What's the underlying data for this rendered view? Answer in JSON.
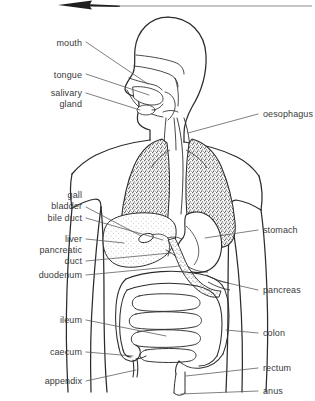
{
  "diagram": {
    "background_color": "#ffffff",
    "stroke_color": "#2b2b2b",
    "label_color": "#3a3a3a",
    "leader_line_color": "#555555",
    "stipple_color": "#4a4a4a",
    "arrow": {
      "name": "scroll-up-arrow",
      "direction": "left"
    },
    "labels_left": [
      {
        "id": "mouth",
        "text": "mouth",
        "text2": "",
        "x": 20,
        "y": 38,
        "width": 62
      },
      {
        "id": "tongue",
        "text": "tongue",
        "text2": "",
        "x": 18,
        "y": 70,
        "width": 64
      },
      {
        "id": "salivary-gland",
        "text": "salivary",
        "text2": "gland",
        "x": 18,
        "y": 89,
        "width": 64
      },
      {
        "id": "gall-bladder",
        "text": "gall",
        "text2": "bladder",
        "x": 18,
        "y": 193,
        "width": 64
      },
      {
        "id": "bile-duct",
        "text": "bile duct",
        "text2": "",
        "x": 13,
        "y": 214,
        "width": 69
      },
      {
        "id": "liver",
        "text": "liver",
        "text2": "",
        "x": 13,
        "y": 235,
        "width": 69
      },
      {
        "id": "pancreatic-duct",
        "text": "pancreatic",
        "text2": "duct",
        "x": 9,
        "y": 246,
        "width": 73
      },
      {
        "id": "duodenum",
        "text": "duodenum",
        "text2": "",
        "x": 9,
        "y": 271,
        "width": 73
      },
      {
        "id": "ileum",
        "text": "ileum",
        "text2": "",
        "x": 14,
        "y": 316,
        "width": 68
      },
      {
        "id": "caecum",
        "text": "caecum",
        "text2": "",
        "x": 14,
        "y": 348,
        "width": 68
      },
      {
        "id": "appendix",
        "text": "appendix",
        "text2": "",
        "x": 10,
        "y": 377,
        "width": 72
      }
    ],
    "labels_right": [
      {
        "id": "oesophagus",
        "text": "oesophagus",
        "x": 263,
        "y": 110
      },
      {
        "id": "stomach",
        "text": "stomach",
        "x": 263,
        "y": 226
      },
      {
        "id": "pancreas",
        "text": "pancreas",
        "x": 263,
        "y": 288
      },
      {
        "id": "colon",
        "text": "colon",
        "x": 263,
        "y": 329
      },
      {
        "id": "rectum",
        "text": "rectum",
        "x": 263,
        "y": 364
      },
      {
        "id": "anus",
        "text": "anus",
        "x": 263,
        "y": 388
      }
    ]
  }
}
